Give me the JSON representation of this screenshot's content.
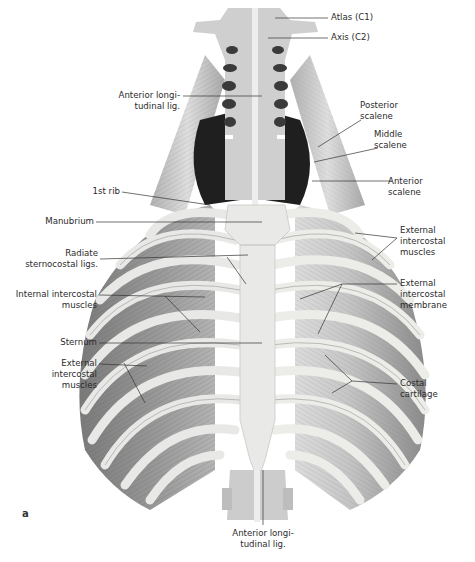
{
  "figure": {
    "panel_letter": "a",
    "labels": {
      "atlas": "Atlas (C1)",
      "axis": "Axis (C2)",
      "ant_long_lig_top": "Anterior longi-\ntudinal lig.",
      "posterior_scalene": "Posterior\nscalene",
      "middle_scalene": "Middle\nscalene",
      "anterior_scalene": "Anterior\nscalene",
      "first_rib": "1st rib",
      "manubrium": "Manubrium",
      "radiate_ligs": "Radiate\nsternocostal ligs.",
      "internal_intercostal": "Internal intercostal\nmuscles",
      "sternum": "Sternum",
      "external_intercostal_left": "External\nintercostal\nmuscles",
      "external_intercostal_right": "External\nintercostal\nmuscles",
      "external_intercostal_membrane": "External\nintercostal\nmembrane",
      "costal_cartilage": "Costal\ncartilage",
      "ant_long_lig_bottom": "Anterior longi-\ntudinal lig."
    },
    "colors": {
      "background": "#ffffff",
      "bone": "#e4e4e2",
      "muscle": "#8e8e8e",
      "dark_cavity": "#1e1e1e",
      "leader_line": "#333333"
    }
  }
}
